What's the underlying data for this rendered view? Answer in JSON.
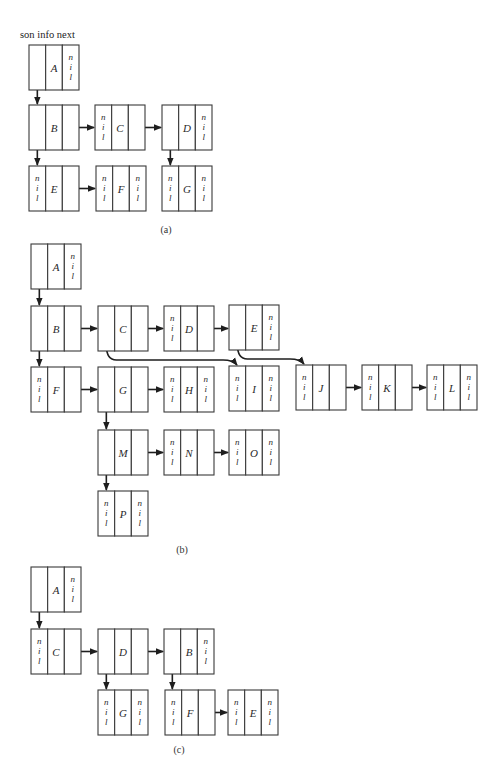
{
  "header": {
    "fields_label": "son info next"
  },
  "colors": {
    "stroke": "#3a3a3a",
    "arrow": "#1e1e1e",
    "background": "#ffffff"
  },
  "nil_text": [
    "n",
    "i",
    "l"
  ],
  "figures": [
    {
      "id": "a",
      "caption": "(a)",
      "caption_pos": [
        166,
        233
      ],
      "nodes": [
        {
          "label": "A",
          "x": 29,
          "y": 45,
          "son_nil": false,
          "next_nil": true
        },
        {
          "label": "B",
          "x": 29,
          "y": 105,
          "son_nil": false,
          "next_nil": false
        },
        {
          "label": "C",
          "x": 95,
          "y": 105,
          "son_nil": true,
          "next_nil": false
        },
        {
          "label": "D",
          "x": 162,
          "y": 105,
          "son_nil": false,
          "next_nil": true
        },
        {
          "label": "E",
          "x": 29,
          "y": 166,
          "son_nil": true,
          "next_nil": false
        },
        {
          "label": "F",
          "x": 96,
          "y": 166,
          "son_nil": true,
          "next_nil": true
        },
        {
          "label": "G",
          "x": 162,
          "y": 166,
          "son_nil": true,
          "next_nil": true
        }
      ],
      "edges": [
        {
          "from": "A",
          "to": "B",
          "type": "son"
        },
        {
          "from": "B",
          "to": "C",
          "type": "next"
        },
        {
          "from": "C",
          "to": "D",
          "type": "next"
        },
        {
          "from": "B",
          "to": "E",
          "type": "son"
        },
        {
          "from": "E",
          "to": "F",
          "type": "next"
        },
        {
          "from": "D",
          "to": "G",
          "type": "son"
        }
      ]
    },
    {
      "id": "b",
      "caption": "(b)",
      "caption_pos": [
        182,
        553
      ],
      "nodes": [
        {
          "label": "A",
          "x": 31,
          "y": 244,
          "son_nil": false,
          "next_nil": true
        },
        {
          "label": "B",
          "x": 31,
          "y": 306,
          "son_nil": false,
          "next_nil": false
        },
        {
          "label": "C",
          "x": 98,
          "y": 306,
          "son_nil": false,
          "next_nil": false
        },
        {
          "label": "D",
          "x": 164,
          "y": 306,
          "son_nil": true,
          "next_nil": false
        },
        {
          "label": "E",
          "x": 229,
          "y": 305,
          "son_nil": false,
          "next_nil": true
        },
        {
          "label": "F",
          "x": 31,
          "y": 367,
          "son_nil": true,
          "next_nil": false
        },
        {
          "label": "G",
          "x": 98,
          "y": 367,
          "son_nil": false,
          "next_nil": false
        },
        {
          "label": "H",
          "x": 164,
          "y": 367,
          "son_nil": true,
          "next_nil": true
        },
        {
          "label": "I",
          "x": 229,
          "y": 366,
          "son_nil": true,
          "next_nil": true
        },
        {
          "label": "J",
          "x": 296,
          "y": 365,
          "son_nil": true,
          "next_nil": false
        },
        {
          "label": "K",
          "x": 362,
          "y": 365,
          "son_nil": true,
          "next_nil": false
        },
        {
          "label": "L",
          "x": 427,
          "y": 365,
          "son_nil": true,
          "next_nil": true
        },
        {
          "label": "M",
          "x": 98,
          "y": 430,
          "son_nil": false,
          "next_nil": false
        },
        {
          "label": "N",
          "x": 164,
          "y": 430,
          "son_nil": true,
          "next_nil": false
        },
        {
          "label": "O",
          "x": 229,
          "y": 430,
          "son_nil": true,
          "next_nil": true
        },
        {
          "label": "P",
          "x": 98,
          "y": 491,
          "son_nil": true,
          "next_nil": true
        }
      ],
      "edges": [
        {
          "from": "A",
          "to": "B",
          "type": "son"
        },
        {
          "from": "B",
          "to": "C",
          "type": "next"
        },
        {
          "from": "C",
          "to": "D",
          "type": "next"
        },
        {
          "from": "D",
          "to": "E",
          "type": "next"
        },
        {
          "from": "B",
          "to": "F",
          "type": "son"
        },
        {
          "from": "F",
          "to": "G",
          "type": "next"
        },
        {
          "from": "G",
          "to": "H",
          "type": "next"
        },
        {
          "from": "C",
          "to": "I",
          "type": "son-curved"
        },
        {
          "from": "E",
          "to": "J",
          "type": "son-curved"
        },
        {
          "from": "J",
          "to": "K",
          "type": "next"
        },
        {
          "from": "K",
          "to": "L",
          "type": "next"
        },
        {
          "from": "G",
          "to": "M",
          "type": "son"
        },
        {
          "from": "M",
          "to": "N",
          "type": "next"
        },
        {
          "from": "N",
          "to": "O",
          "type": "next"
        },
        {
          "from": "M",
          "to": "P",
          "type": "son"
        }
      ]
    },
    {
      "id": "c",
      "caption": "(c)",
      "caption_pos": [
        179,
        753
      ],
      "nodes": [
        {
          "label": "A",
          "x": 31,
          "y": 567,
          "son_nil": false,
          "next_nil": true
        },
        {
          "label": "C",
          "x": 31,
          "y": 629,
          "son_nil": true,
          "next_nil": false
        },
        {
          "label": "D",
          "x": 98,
          "y": 629,
          "son_nil": false,
          "next_nil": false
        },
        {
          "label": "B",
          "x": 164,
          "y": 629,
          "son_nil": false,
          "next_nil": true
        },
        {
          "label": "G",
          "x": 98,
          "y": 690,
          "son_nil": true,
          "next_nil": true
        },
        {
          "label": "F",
          "x": 165,
          "y": 690,
          "son_nil": true,
          "next_nil": false
        },
        {
          "label": "E",
          "x": 228,
          "y": 690,
          "son_nil": true,
          "next_nil": true
        }
      ],
      "edges": [
        {
          "from": "A",
          "to": "C",
          "type": "son"
        },
        {
          "from": "C",
          "to": "D",
          "type": "next"
        },
        {
          "from": "D",
          "to": "B",
          "type": "next"
        },
        {
          "from": "D",
          "to": "G",
          "type": "son"
        },
        {
          "from": "B",
          "to": "F",
          "type": "son"
        },
        {
          "from": "F",
          "to": "E",
          "type": "next"
        }
      ]
    }
  ],
  "node_size": {
    "w": 50,
    "h": 45
  }
}
